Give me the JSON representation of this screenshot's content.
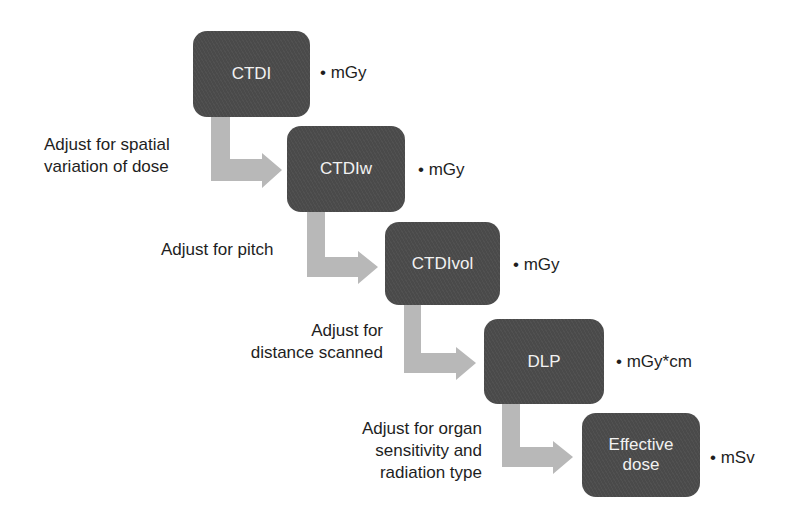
{
  "diagram": {
    "arrow_color": "#b5b5b5",
    "box_color": "#4a4a4a",
    "steps": [
      {
        "label": "CTDI",
        "unit": "• mGy"
      },
      {
        "label": "CTDIw",
        "unit": "• mGy"
      },
      {
        "label": "CTDIvol",
        "unit": "• mGy"
      },
      {
        "label": "DLP",
        "unit": "• mGy*cm"
      },
      {
        "label_line1": "Effective",
        "label_line2": "dose",
        "unit": "• mSv"
      }
    ],
    "adjustments": [
      {
        "line1": "Adjust for spatial",
        "line2": "variation of dose"
      },
      {
        "line1": "Adjust for pitch"
      },
      {
        "line1": "Adjust for",
        "line2": "distance scanned"
      },
      {
        "line1": "Adjust for organ",
        "line2": "sensitivity and",
        "line3": "radiation type"
      }
    ]
  }
}
